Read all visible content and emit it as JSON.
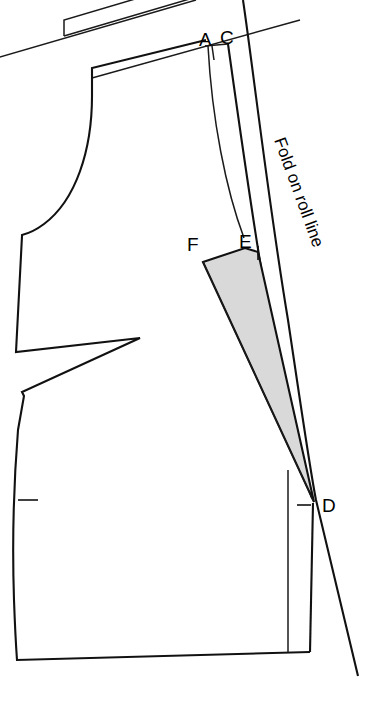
{
  "diagram": {
    "type": "sewing-pattern-draft",
    "background_color": "#ffffff",
    "line_color": "#111111",
    "wedge_fill_color": "#d9d9d9",
    "point_labels": [
      {
        "id": "A",
        "text": "A",
        "x": 206,
        "y": 38
      },
      {
        "id": "C",
        "text": "C",
        "x": 226,
        "y": 36
      },
      {
        "id": "F",
        "text": "F",
        "x": 193,
        "y": 243
      },
      {
        "id": "E",
        "text": "E",
        "x": 245,
        "y": 240
      },
      {
        "id": "D",
        "text": "D",
        "x": 330,
        "y": 500
      }
    ],
    "annotations": [
      {
        "id": "fold-on-roll-line",
        "text": "Fold on roll line",
        "rotation_deg": 70,
        "anchor_x": 274,
        "anchor_y": 140
      }
    ],
    "notches": [
      {
        "id": "side-seam-notch",
        "x": 24,
        "y": 500
      },
      {
        "id": "point-e-notch",
        "x": 258,
        "y": 246
      },
      {
        "id": "point-d-notch",
        "x": 303,
        "y": 505
      }
    ]
  }
}
